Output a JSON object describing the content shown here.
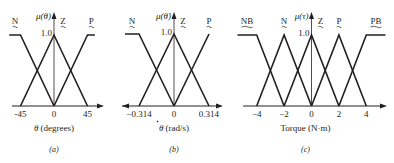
{
  "figure": {
    "background": "#ffffff",
    "line_color": "#231f20"
  },
  "chart_data": [
    {
      "type": "line",
      "panel_label": "(a)",
      "title": "",
      "xlabel": "θ (degrees)",
      "ylabel": "μ(θ)",
      "ytick_label": "1.0",
      "xticks": [
        -45,
        0,
        45
      ],
      "xtick_labels": [
        "-45",
        "0",
        "45"
      ],
      "ylim": [
        0,
        1
      ],
      "grid": false,
      "legend": null,
      "series": [
        {
          "name": "N",
          "x": [
            -60,
            -45,
            0
          ],
          "y": [
            1,
            1,
            0
          ]
        },
        {
          "name": "Z",
          "x": [
            -45,
            0,
            45
          ],
          "y": [
            0,
            1,
            0
          ]
        },
        {
          "name": "P",
          "x": [
            0,
            45,
            55
          ],
          "y": [
            0,
            1,
            1
          ]
        }
      ],
      "px": {
        "x0": 54,
        "xunit": 0.7444,
        "ybase": 106,
        "ytop": 35,
        "axis_left": 12,
        "axis_right": 104,
        "axis_top": 12,
        "left_arrow": false
      }
    },
    {
      "type": "line",
      "panel_label": "(b)",
      "title": "",
      "xlabel": "θ̇ (rad/s)",
      "ylabel": "μ(θ̇)",
      "ytick_label": "1.0",
      "xticks": [
        -0.314,
        0,
        0.314
      ],
      "xtick_labels": [
        "−0.314",
        "0",
        "0.314"
      ],
      "ylim": [
        0,
        1
      ],
      "grid": false,
      "legend": null,
      "series": [
        {
          "name": "N",
          "x": [
            -0.44,
            -0.314,
            0
          ],
          "y": [
            1,
            1,
            0
          ]
        },
        {
          "name": "Z",
          "x": [
            -0.314,
            0,
            0.314
          ],
          "y": [
            0,
            1,
            0
          ]
        },
        {
          "name": "P",
          "x": [
            0,
            0.314
          ],
          "y": [
            0,
            1
          ]
        }
      ],
      "px": {
        "x0": 174,
        "xunit": 111.46,
        "ybase": 106,
        "ytop": 34,
        "axis_left": 122,
        "axis_right": 223,
        "axis_top": 12,
        "left_arrow": true
      }
    },
    {
      "type": "line",
      "panel_label": "(c)",
      "title": "",
      "xlabel": "Torque (N·m)",
      "ylabel": "μ(τ)",
      "ytick_label": "1.0",
      "xticks": [
        -4,
        -2,
        0,
        2,
        4
      ],
      "xtick_labels": [
        "−4",
        "−2",
        "0",
        "2",
        "4"
      ],
      "ylim": [
        0,
        1
      ],
      "grid": false,
      "legend": null,
      "series": [
        {
          "name": "NB",
          "x": [
            -5.4,
            -4,
            -2
          ],
          "y": [
            1,
            1,
            0
          ]
        },
        {
          "name": "N",
          "x": [
            -4,
            -2,
            0
          ],
          "y": [
            0,
            1,
            0
          ]
        },
        {
          "name": "Z",
          "x": [
            -2,
            0,
            2
          ],
          "y": [
            0,
            1,
            0
          ]
        },
        {
          "name": "P",
          "x": [
            0,
            2,
            4
          ],
          "y": [
            0,
            1,
            0
          ]
        },
        {
          "name": "PB",
          "x": [
            2,
            4,
            5.4
          ],
          "y": [
            0,
            1,
            1
          ]
        }
      ],
      "px": {
        "x0": 311.5,
        "xunit": 13.7,
        "ybase": 106,
        "ytop": 35,
        "axis_left": 243,
        "axis_right": 387,
        "axis_top": 12,
        "left_arrow": false
      }
    }
  ]
}
